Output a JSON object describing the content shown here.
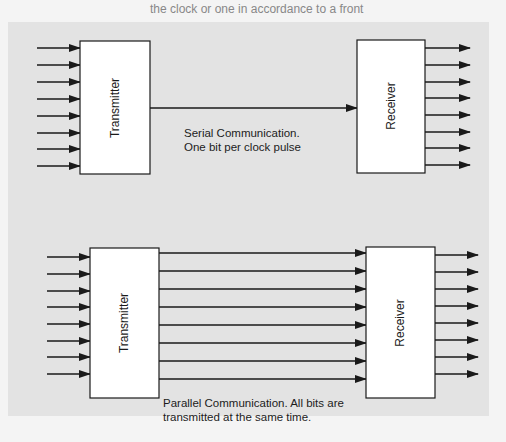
{
  "page": {
    "background_top_text": "the clock or one in accordance to a front",
    "bleed_text_lines": [
      "Serial Communication with line as clock",
      "data bits are sent over different connecting lines",
      "to the bus, with each of the clock pulses sent",
      "to transmit eight bits to a receiver in parallel"
    ]
  },
  "diagram_serial": {
    "transmitter_label": "Transmitter",
    "receiver_label": "Receiver",
    "caption_line1": "Serial Communication.",
    "caption_line2": "One bit per clock pulse",
    "input_count": 8,
    "output_count": 8,
    "link_count": 1
  },
  "diagram_parallel": {
    "transmitter_label": "Transmitter",
    "receiver_label": "Receiver",
    "caption_line1": "Parallel Communication. All bits are",
    "caption_line2": "transmitted at the same time.",
    "input_count": 8,
    "output_count": 8,
    "link_count": 8
  },
  "colors": {
    "panel": "#e3e3e3",
    "page": "#f4f4f4",
    "stroke": "#1a1a1a",
    "box_fill": "#ffffff"
  }
}
